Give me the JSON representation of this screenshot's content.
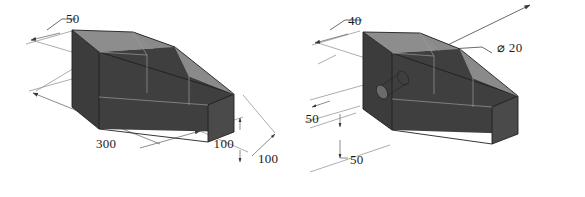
{
  "sheet": {
    "width": 585,
    "height": 197,
    "background": "#ffffff",
    "title": "Isometric dimensioned block views"
  },
  "colors": {
    "face_front_dark": "#3c3c3c",
    "face_side_dark": "#454545",
    "face_top_light": "#8d8d8d",
    "face_slope_light": "#8a8a8a",
    "face_top_mid": "#707070",
    "edge_dark": "#1f1f1f",
    "edge_soft": "#9a9a9a",
    "dimension_line": "#6e6e6e",
    "text": "#1a1a1a"
  },
  "figures": [
    {
      "id": "figure-left",
      "name": "ramp-block-plain",
      "description": "Isometric rectangular block with sloped ramp top, no hole",
      "dimensions": [
        {
          "id": "dim-left-50",
          "label": "50",
          "value": 50,
          "unit": "mm",
          "kind": "leader",
          "measures": "top-face-width",
          "x": 66,
          "y": 18
        },
        {
          "id": "dim-left-300",
          "label": "300",
          "value": 300,
          "unit": "mm",
          "kind": "linear",
          "measures": "overall-length",
          "x": 96,
          "y": 144
        },
        {
          "id": "dim-left-100-height",
          "label": "100",
          "value": 100,
          "unit": "mm",
          "kind": "linear",
          "measures": "block-height",
          "x": 234,
          "y": 148
        },
        {
          "id": "dim-left-100-depth",
          "label": "100",
          "value": 100,
          "unit": "mm",
          "kind": "linear",
          "measures": "block-depth",
          "x": 258,
          "y": 159
        }
      ]
    },
    {
      "id": "figure-right",
      "name": "ramp-block-with-hole",
      "description": "Isometric rectangular block with sloped ramp top and a through hole",
      "dimensions": [
        {
          "id": "dim-right-40",
          "label": "40",
          "value": 40,
          "unit": "mm",
          "kind": "leader",
          "measures": "top-face-width",
          "x": 348,
          "y": 29
        },
        {
          "id": "dim-right-dia",
          "label": "⌀ 20",
          "value": 20,
          "unit": "mm",
          "kind": "diameter-leader",
          "measures": "hole-diameter",
          "x": 497,
          "y": 52
        },
        {
          "id": "dim-right-50-a",
          "label": "50",
          "value": 50,
          "unit": "mm",
          "kind": "linear",
          "measures": "hole-axis-from-top",
          "x": 319,
          "y": 119
        },
        {
          "id": "dim-right-50-b",
          "label": "50",
          "value": 50,
          "unit": "mm",
          "kind": "linear",
          "measures": "hole-axis-from-end",
          "x": 348,
          "y": 162
        }
      ]
    }
  ]
}
